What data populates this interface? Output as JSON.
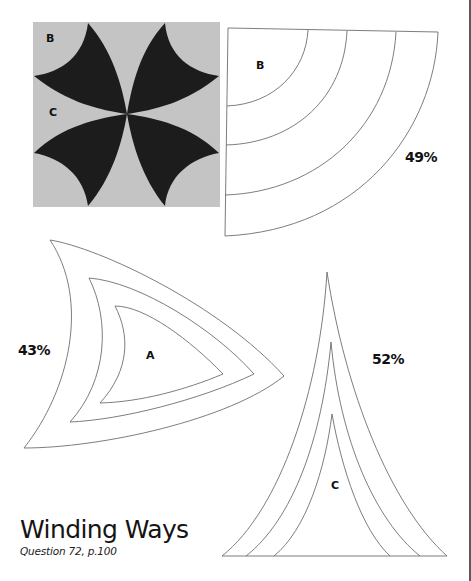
{
  "title": "Winding Ways",
  "subtitle": "Question 72, p.100",
  "block": {
    "labels": {
      "b": "B",
      "c": "C"
    },
    "colors": {
      "background": "#c4c4c4",
      "petal": "#1c1c1c"
    }
  },
  "templates": {
    "b": {
      "label": "B",
      "scale": "49%"
    },
    "a": {
      "label": "A",
      "scale": "43%"
    },
    "c": {
      "label": "C",
      "scale": "52%"
    }
  },
  "colors": {
    "outline": "#6e6e6e",
    "text": "#111111"
  }
}
